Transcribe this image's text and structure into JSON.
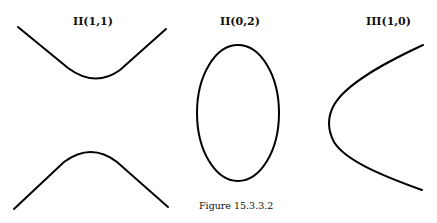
{
  "panels": [
    {
      "label": "II(1,1)",
      "shape": "hyperbola"
    },
    {
      "label": "II(0,2)",
      "shape": "ellipse"
    },
    {
      "label": "III(1,0)",
      "shape": "parabola"
    }
  ],
  "caption": "Figure 15.3.3.2"
}
